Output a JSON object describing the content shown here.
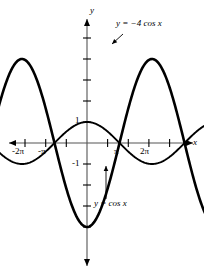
{
  "figure": {
    "background_color": "#ffffff",
    "curve_color": "#000000",
    "axis_color": "#555555"
  },
  "axes": {
    "x_axis_label": "x",
    "y_axis_label": "y",
    "x_axis_name": "horizontal-axis",
    "y_axis_name": "vertical-axis",
    "x_ticks": [
      "-2π",
      "-π",
      "π",
      "2π"
    ],
    "y_ticks": [
      "1",
      "-1"
    ],
    "x_range": [
      -7.85,
      8.4
    ],
    "y_range": [
      -4.6,
      4.9
    ],
    "origin_px": [
      87,
      143
    ],
    "unit_px_x": 20.7,
    "unit_px_y": 21.0,
    "grid": false
  },
  "annotations": [
    {
      "id": "label-neg4cos",
      "text": "y = −4 cos x",
      "x_px": 116,
      "y_px": 23,
      "arrow_from": [
        123,
        34
      ],
      "arrow_to": [
        112,
        44
      ]
    },
    {
      "id": "label-cos",
      "text": "y = cos x",
      "x_px": 94,
      "y_px": 202,
      "arrow_from": [
        106,
        199
      ],
      "arrow_to": [
        106,
        166
      ]
    }
  ],
  "chart_data": {
    "type": "line",
    "title": "",
    "xlabel": "x",
    "ylabel": "y",
    "xlim": [
      -7.85,
      8.4
    ],
    "ylim": [
      -4.6,
      4.9
    ],
    "grid": false,
    "legend_position": "inline-annotations",
    "xticks": [
      -6.2832,
      -3.1416,
      3.1416,
      6.2832
    ],
    "xticklabels": [
      "-2π",
      "-π",
      "π",
      "2π"
    ],
    "yticks": [
      1,
      -1
    ],
    "yticklabels": [
      "1",
      "-1"
    ],
    "series": [
      {
        "name": "y = cos x",
        "formula": "cos(x)",
        "amplitude": 1,
        "period": 6.2832,
        "phase": 0,
        "color": "#000000",
        "maxima_x": [
          -6.2832,
          0,
          6.2832
        ],
        "minima_x": [
          -3.1416,
          3.1416
        ],
        "zeros_x": [
          -4.712,
          -1.571,
          1.571,
          4.712,
          7.854
        ]
      },
      {
        "name": "y = -4 cos x",
        "formula": "-4*cos(x)",
        "amplitude": 4,
        "period": 6.2832,
        "phase": 3.1416,
        "color": "#000000",
        "maxima_x": [
          -3.1416,
          3.1416
        ],
        "minima_x": [
          -6.2832,
          0,
          6.2832
        ],
        "zeros_x": [
          -4.712,
          -1.571,
          1.571,
          4.712,
          7.854
        ]
      }
    ]
  }
}
